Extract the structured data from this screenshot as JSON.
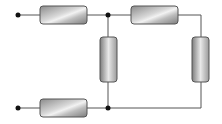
{
  "diagram": {
    "type": "resistor-network",
    "title": "",
    "colors": {
      "wire": "#555555",
      "terminal": "#111111",
      "resistor_border": "#555555",
      "resistor_fill_dark": "#8a8a8a",
      "resistor_fill_light": "#f2f2f2"
    },
    "terminals": [
      {
        "id": "in_top",
        "x": 18,
        "y": 15
      },
      {
        "id": "in_bottom",
        "x": 18,
        "y": 108
      }
    ],
    "junctions": [
      {
        "id": "j_top",
        "x": 108,
        "y": 15
      },
      {
        "id": "j_bottom",
        "x": 108,
        "y": 108
      }
    ],
    "resistors": [
      {
        "id": "R1",
        "orientation": "horizontal",
        "position": "top-left",
        "x": 40,
        "y": 6,
        "w": 47,
        "h": 18
      },
      {
        "id": "R2",
        "orientation": "horizontal",
        "position": "top-right",
        "x": 131,
        "y": 6,
        "w": 47,
        "h": 18
      },
      {
        "id": "R3",
        "orientation": "vertical",
        "position": "middle",
        "x": 100,
        "y": 37,
        "w": 17,
        "h": 45
      },
      {
        "id": "R4",
        "orientation": "vertical",
        "position": "right",
        "x": 192,
        "y": 37,
        "w": 17,
        "h": 45
      },
      {
        "id": "R5",
        "orientation": "horizontal",
        "position": "bottom-left",
        "x": 40,
        "y": 99,
        "w": 47,
        "h": 18
      }
    ],
    "labels": []
  }
}
